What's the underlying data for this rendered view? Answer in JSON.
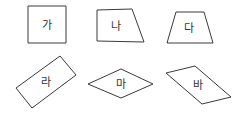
{
  "figure": {
    "shapes": [
      {
        "label": "가",
        "type": "square",
        "points": "28,6 66,6 66,43 28,43",
        "cx": 47,
        "cy": 25
      },
      {
        "label": "나",
        "type": "trapezoid",
        "points": "97,10 132,9 144,42 97,41",
        "cx": 116,
        "cy": 26
      },
      {
        "label": "다",
        "type": "trapezoid",
        "points": "176,12 204,12 213,43 167,43",
        "cx": 189,
        "cy": 28
      },
      {
        "label": "라",
        "type": "rectangle",
        "points": "60,56 76,75 32,108 16,88",
        "cx": 46,
        "cy": 82
      },
      {
        "label": "마",
        "type": "rhombus",
        "points": "88,84 121,69 153,84 121,98",
        "cx": 121,
        "cy": 84
      },
      {
        "label": "바",
        "type": "parallelogram",
        "points": "166,73 195,66 231,97 202,104",
        "cx": 198,
        "cy": 85
      }
    ]
  }
}
